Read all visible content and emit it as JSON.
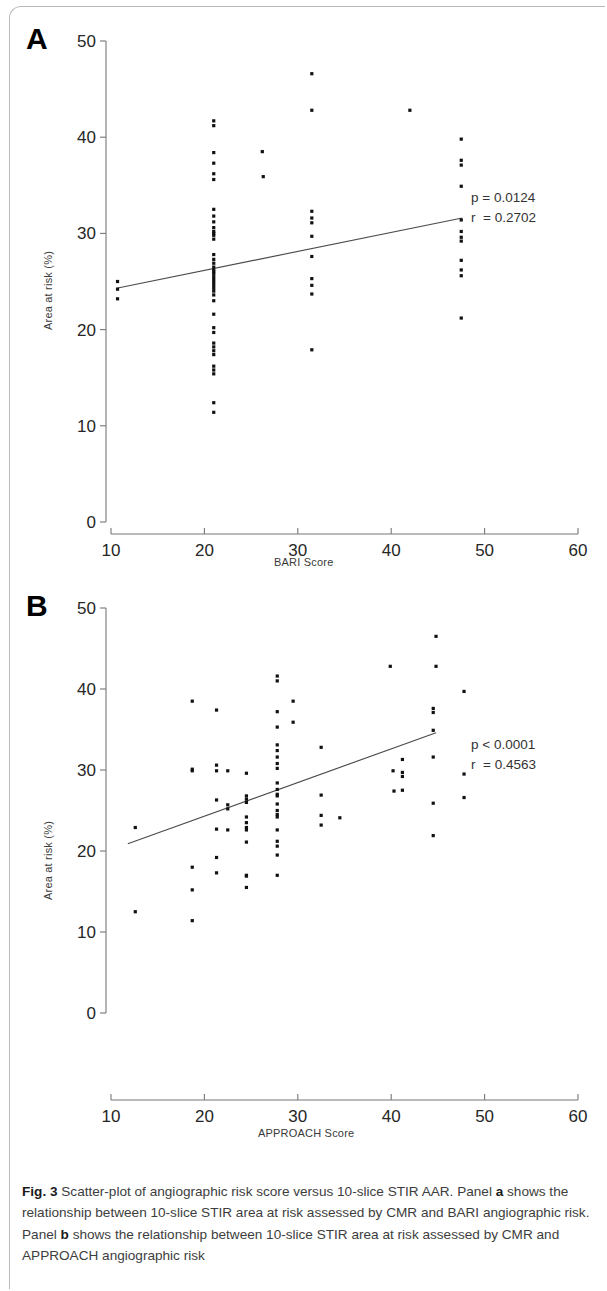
{
  "figure": {
    "label": "Fig. 3",
    "caption_text": " Scatter-plot of angiographic risk score versus 10-slice STIR AAR. Panel ",
    "caption_b1": "a",
    "caption_text2": " shows the relationship between 10-slice STIR area at risk assessed by CMR and BARI angiographic risk. Panel ",
    "caption_b2": "b",
    "caption_text3": " shows the relationship between 10-slice STIR area at risk assessed by CMR and APPROACH angiographic risk"
  },
  "panel_a": {
    "letter": "A",
    "stats_line1": "p = 0.0124",
    "stats_line2": "r  = 0.2702"
  },
  "panel_b": {
    "letter": "B",
    "stats_line1": "p < 0.0001",
    "stats_line2": "r  = 0.4563"
  },
  "chart_data": [
    {
      "type": "scatter",
      "panel": "A",
      "title": "",
      "xlabel": "BARI Score",
      "ylabel": "Area at risk (%)",
      "xlim": [
        10,
        60
      ],
      "ylim": [
        0,
        50
      ],
      "xticks": [
        10,
        20,
        30,
        40,
        50,
        60
      ],
      "yticks": [
        0,
        10,
        20,
        30,
        40,
        50
      ],
      "grid": false,
      "legend": false,
      "annotations": [
        "p = 0.0124",
        "r  = 0.2702"
      ],
      "stats": {
        "p": "0.0124",
        "r": "0.2702"
      },
      "trendline": {
        "x": [
          10.6,
          47.6
        ],
        "y": [
          24.3,
          31.6
        ]
      },
      "points": [
        [
          10.7,
          25.0
        ],
        [
          10.7,
          24.2
        ],
        [
          10.7,
          23.2
        ],
        [
          21.0,
          41.7
        ],
        [
          21.0,
          41.2
        ],
        [
          21.0,
          38.4
        ],
        [
          21.0,
          37.3
        ],
        [
          21.0,
          36.2
        ],
        [
          21.0,
          35.6
        ],
        [
          21.0,
          32.5
        ],
        [
          21.0,
          31.8
        ],
        [
          21.0,
          31.2
        ],
        [
          21.0,
          30.6
        ],
        [
          21.0,
          30.2
        ],
        [
          21.0,
          30.0
        ],
        [
          21.0,
          29.8
        ],
        [
          21.0,
          29.4
        ],
        [
          21.0,
          27.8
        ],
        [
          21.0,
          27.3
        ],
        [
          21.0,
          26.9
        ],
        [
          21.0,
          26.5
        ],
        [
          21.0,
          26.2
        ],
        [
          21.0,
          26.0
        ],
        [
          21.0,
          25.8
        ],
        [
          21.0,
          25.5
        ],
        [
          21.0,
          25.2
        ],
        [
          21.0,
          24.9
        ],
        [
          21.0,
          24.6
        ],
        [
          21.0,
          24.3
        ],
        [
          21.0,
          24.0
        ],
        [
          21.0,
          23.6
        ],
        [
          21.0,
          23.0
        ],
        [
          21.0,
          21.6
        ],
        [
          21.0,
          20.2
        ],
        [
          21.0,
          19.7
        ],
        [
          21.0,
          18.6
        ],
        [
          21.0,
          18.2
        ],
        [
          21.0,
          17.8
        ],
        [
          21.0,
          17.4
        ],
        [
          21.0,
          16.2
        ],
        [
          21.0,
          15.8
        ],
        [
          21.0,
          15.4
        ],
        [
          21.0,
          12.4
        ],
        [
          21.0,
          11.4
        ],
        [
          26.2,
          38.5
        ],
        [
          26.3,
          35.9
        ],
        [
          31.5,
          46.6
        ],
        [
          31.5,
          42.8
        ],
        [
          31.5,
          32.3
        ],
        [
          31.5,
          31.6
        ],
        [
          31.5,
          31.1
        ],
        [
          31.5,
          29.7
        ],
        [
          31.5,
          27.6
        ],
        [
          31.5,
          25.3
        ],
        [
          31.5,
          24.6
        ],
        [
          31.5,
          23.7
        ],
        [
          31.5,
          17.9
        ],
        [
          42.0,
          42.8
        ],
        [
          47.5,
          39.8
        ],
        [
          47.5,
          37.6
        ],
        [
          47.5,
          37.1
        ],
        [
          47.5,
          34.9
        ],
        [
          47.5,
          31.4
        ],
        [
          47.5,
          30.2
        ],
        [
          47.5,
          29.6
        ],
        [
          47.5,
          29.2
        ],
        [
          47.5,
          27.2
        ],
        [
          47.5,
          26.2
        ],
        [
          47.5,
          25.6
        ],
        [
          47.5,
          21.2
        ]
      ]
    },
    {
      "type": "scatter",
      "panel": "B",
      "title": "",
      "xlabel": "APPROACH Score",
      "ylabel": "Area at risk (%)",
      "xlim": [
        10,
        60
      ],
      "ylim": [
        0,
        50
      ],
      "xticks": [
        10,
        20,
        30,
        40,
        50,
        60
      ],
      "yticks": [
        0,
        10,
        20,
        30,
        40,
        50
      ],
      "grid": false,
      "legend": false,
      "annotations": [
        "p < 0.0001",
        "r  = 0.4563"
      ],
      "stats": {
        "p": "<0.0001",
        "r": "0.4563"
      },
      "trendline": {
        "x": [
          11.8,
          44.8
        ],
        "y": [
          20.9,
          34.6
        ]
      },
      "points": [
        [
          12.6,
          22.9
        ],
        [
          12.6,
          12.5
        ],
        [
          18.7,
          38.5
        ],
        [
          18.7,
          30.1
        ],
        [
          18.7,
          29.9
        ],
        [
          18.7,
          18.0
        ],
        [
          18.7,
          15.2
        ],
        [
          18.7,
          11.4
        ],
        [
          21.3,
          37.4
        ],
        [
          21.3,
          30.6
        ],
        [
          21.3,
          29.9
        ],
        [
          21.3,
          26.3
        ],
        [
          21.3,
          22.7
        ],
        [
          21.3,
          19.2
        ],
        [
          21.3,
          17.3
        ],
        [
          22.5,
          29.9
        ],
        [
          22.5,
          25.7
        ],
        [
          22.5,
          25.2
        ],
        [
          22.5,
          22.6
        ],
        [
          24.5,
          29.6
        ],
        [
          24.5,
          26.8
        ],
        [
          24.5,
          26.4
        ],
        [
          24.5,
          26.0
        ],
        [
          24.5,
          24.2
        ],
        [
          24.5,
          23.5
        ],
        [
          24.5,
          22.9
        ],
        [
          24.5,
          22.6
        ],
        [
          24.5,
          21.1
        ],
        [
          24.5,
          17.0
        ],
        [
          24.5,
          16.9
        ],
        [
          24.5,
          15.5
        ],
        [
          27.8,
          41.6
        ],
        [
          27.8,
          41.0
        ],
        [
          27.8,
          37.2
        ],
        [
          27.8,
          35.3
        ],
        [
          27.8,
          33.1
        ],
        [
          27.8,
          32.4
        ],
        [
          27.8,
          31.6
        ],
        [
          27.8,
          30.8
        ],
        [
          27.8,
          30.2
        ],
        [
          27.8,
          28.4
        ],
        [
          27.8,
          27.6
        ],
        [
          27.8,
          27.0
        ],
        [
          27.8,
          26.8
        ],
        [
          27.8,
          25.8
        ],
        [
          27.8,
          25.0
        ],
        [
          27.8,
          24.5
        ],
        [
          27.8,
          24.2
        ],
        [
          27.8,
          22.6
        ],
        [
          27.8,
          21.2
        ],
        [
          27.8,
          20.6
        ],
        [
          27.8,
          19.5
        ],
        [
          27.8,
          17.0
        ],
        [
          29.5,
          38.5
        ],
        [
          29.5,
          35.9
        ],
        [
          32.5,
          32.8
        ],
        [
          32.5,
          26.9
        ],
        [
          32.5,
          24.4
        ],
        [
          32.5,
          23.2
        ],
        [
          34.5,
          24.1
        ],
        [
          39.9,
          42.8
        ],
        [
          40.2,
          29.9
        ],
        [
          41.2,
          31.3
        ],
        [
          41.2,
          29.7
        ],
        [
          41.2,
          29.2
        ],
        [
          41.2,
          27.5
        ],
        [
          40.3,
          27.4
        ],
        [
          44.8,
          46.5
        ],
        [
          44.8,
          42.8
        ],
        [
          44.5,
          37.6
        ],
        [
          44.5,
          37.1
        ],
        [
          44.5,
          34.9
        ],
        [
          44.5,
          31.6
        ],
        [
          44.5,
          25.9
        ],
        [
          44.5,
          21.9
        ],
        [
          47.8,
          39.7
        ],
        [
          47.8,
          29.5
        ],
        [
          47.8,
          26.6
        ]
      ]
    }
  ]
}
